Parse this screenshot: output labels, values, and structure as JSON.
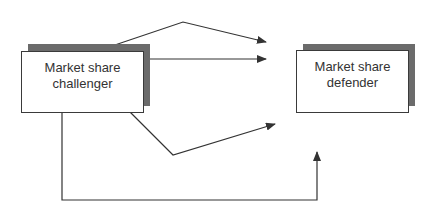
{
  "diagram": {
    "nodes": [
      {
        "id": "challenger",
        "label_line1": "Market share",
        "label_line2": "challenger"
      },
      {
        "id": "defender",
        "label_line1": "Market share",
        "label_line2": "defender"
      }
    ],
    "edges": [
      {
        "from": "challenger",
        "to": "defender-area",
        "path": "up-over-top"
      },
      {
        "from": "challenger",
        "to": "defender-area",
        "path": "straight"
      },
      {
        "from": "challenger",
        "to": "defender-area",
        "path": "down-under"
      },
      {
        "from": "challenger",
        "to": "defender",
        "path": "bottom-loop"
      }
    ],
    "colors": {
      "line": "#333333",
      "shadow": "#6b6b6b",
      "box_border": "#3a3a3a"
    }
  }
}
